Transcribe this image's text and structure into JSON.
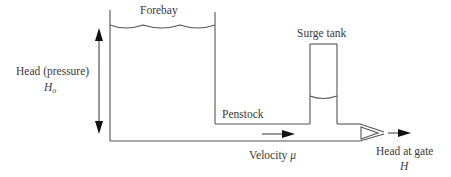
{
  "diagram": {
    "labels": {
      "forebay": "Forebay",
      "surge_tank": "Surge tank",
      "head_pressure": "Head (pressure)",
      "head_symbol": "H",
      "head_symbol_sub": "o",
      "penstock": "Penstock",
      "velocity": "Velocity",
      "velocity_symbol": "μ",
      "head_at_gate": "Head at gate",
      "head_at_gate_symbol": "H"
    },
    "colors": {
      "line": "#555555",
      "arrow": "#111111",
      "text": "#3a3a3a"
    }
  }
}
